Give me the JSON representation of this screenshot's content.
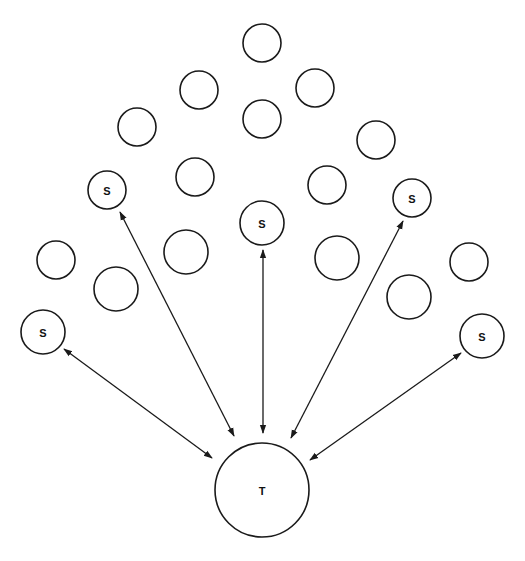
{
  "diagram": {
    "type": "network",
    "colors": {
      "stroke": "#1a1a1a",
      "fill": "#ffffff",
      "text": "#111111"
    },
    "target": {
      "id": "T",
      "label": "T",
      "cx": 262,
      "cy": 490,
      "r": 47
    },
    "sources": [
      {
        "id": "S1",
        "label": "S",
        "cx": 43,
        "cy": 332,
        "r": 22
      },
      {
        "id": "S2",
        "label": "S",
        "cx": 107,
        "cy": 190,
        "r": 19
      },
      {
        "id": "S3",
        "label": "S",
        "cx": 262,
        "cy": 223,
        "r": 22
      },
      {
        "id": "S4",
        "label": "S",
        "cx": 412,
        "cy": 198,
        "r": 19
      },
      {
        "id": "S5",
        "label": "S",
        "cx": 482,
        "cy": 336,
        "r": 22
      }
    ],
    "unlabeled_nodes": [
      {
        "cx": 262,
        "cy": 43,
        "r": 19
      },
      {
        "cx": 199,
        "cy": 90,
        "r": 19
      },
      {
        "cx": 315,
        "cy": 88,
        "r": 19
      },
      {
        "cx": 262,
        "cy": 119,
        "r": 19
      },
      {
        "cx": 137,
        "cy": 127,
        "r": 19
      },
      {
        "cx": 376,
        "cy": 140,
        "r": 19
      },
      {
        "cx": 195,
        "cy": 177,
        "r": 19
      },
      {
        "cx": 327,
        "cy": 185,
        "r": 19
      },
      {
        "cx": 186,
        "cy": 252,
        "r": 22
      },
      {
        "cx": 337,
        "cy": 258,
        "r": 22
      },
      {
        "cx": 56,
        "cy": 260,
        "r": 19
      },
      {
        "cx": 116,
        "cy": 289,
        "r": 22
      },
      {
        "cx": 469,
        "cy": 262,
        "r": 19
      },
      {
        "cx": 409,
        "cy": 297,
        "r": 22
      }
    ],
    "edges": [
      {
        "from": "S1",
        "to": "T",
        "direction": "both",
        "x1": 64,
        "y1": 349,
        "x2": 212,
        "y2": 458
      },
      {
        "from": "S2",
        "to": "T",
        "direction": "both",
        "x1": 120,
        "y1": 212,
        "x2": 234,
        "y2": 436
      },
      {
        "from": "S3",
        "to": "T",
        "direction": "both",
        "x1": 263,
        "y1": 250,
        "x2": 263,
        "y2": 433
      },
      {
        "from": "S4",
        "to": "T",
        "direction": "both",
        "x1": 403,
        "y1": 221,
        "x2": 291,
        "y2": 438
      },
      {
        "from": "S5",
        "to": "T",
        "direction": "both",
        "x1": 461,
        "y1": 353,
        "x2": 310,
        "y2": 460
      }
    ]
  }
}
